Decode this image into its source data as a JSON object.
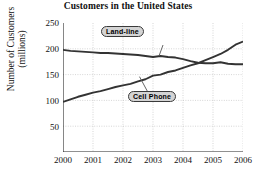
{
  "chart_data": {
    "type": "line",
    "title": "Customers in the United States",
    "xlabel": "Year",
    "ylabel_line1": "Number of Customers",
    "ylabel_line2": "(millions)",
    "xticks": [
      "2000",
      "2001",
      "2002",
      "2003",
      "2004",
      "2005",
      "2006"
    ],
    "yticks": [
      "250",
      "200",
      "150",
      "100",
      "50"
    ],
    "xlim": [
      2000,
      2006
    ],
    "ylim": [
      0,
      250
    ],
    "grid": true,
    "legend_position": "callout-annotations",
    "x": [
      2000,
      2000.25,
      2000.5,
      2000.75,
      2001,
      2001.25,
      2001.5,
      2001.75,
      2002,
      2002.25,
      2002.5,
      2002.75,
      2003,
      2003.25,
      2003.5,
      2003.75,
      2004,
      2004.25,
      2004.5,
      2004.75,
      2005,
      2005.25,
      2005.5,
      2005.75,
      2006
    ],
    "series": [
      {
        "name": "Land-line",
        "color": "#333333",
        "values": [
          198,
          196,
          195,
          194,
          193,
          192,
          192,
          191,
          190,
          189,
          188,
          186,
          184,
          186,
          184,
          183,
          180,
          176,
          173,
          172,
          172,
          174,
          171,
          170,
          170
        ]
      },
      {
        "name": "Cell Phone",
        "color": "#333333",
        "values": [
          97,
          102,
          107,
          111,
          115,
          118,
          122,
          126,
          129,
          132,
          137,
          141,
          148,
          150,
          155,
          158,
          163,
          168,
          172,
          178,
          184,
          190,
          198,
          208,
          214
        ]
      }
    ],
    "annotations": [
      {
        "label": "Land-line",
        "target_year": 2003.2,
        "target_value": 186
      },
      {
        "label": "Cell Phone",
        "target_year": 2002.55,
        "target_value": 146
      }
    ]
  }
}
